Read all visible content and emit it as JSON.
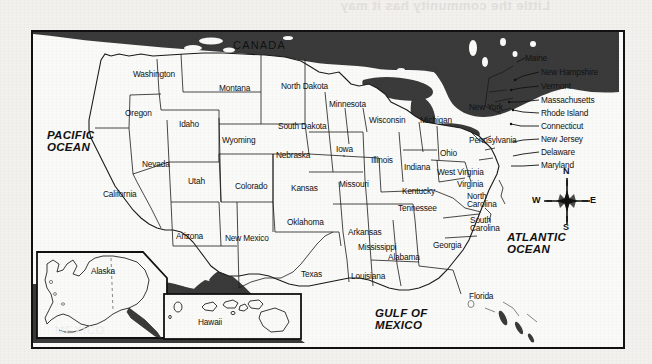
{
  "page": {
    "bleed_through_text": "Little the community has it may",
    "background_color": "#f2f1ee"
  },
  "map": {
    "frame_color": "#111111",
    "land_color": "#fafaf8",
    "water_color": "#3a3a3a",
    "title": "United States political map with state labels",
    "countries": [
      {
        "name": "CANADA",
        "x": 200,
        "y": 14
      },
      {
        "name": "MEXICO",
        "x": 205,
        "y": 295
      }
    ],
    "oceans": [
      {
        "name": "PACIFIC\nOCEAN",
        "line1": "PACIFIC",
        "line2": "OCEAN",
        "x": 14,
        "y": 102
      },
      {
        "name": "ATLANTIC\nOCEAN",
        "line1": "ATLANTIC",
        "line2": "OCEAN",
        "x": 476,
        "y": 205
      },
      {
        "name": "GULF OF\nMEXICO",
        "line1": "GULF OF",
        "line2": "MEXICO",
        "x": 345,
        "y": 281
      }
    ],
    "states": [
      {
        "name": "Washington",
        "x": 100,
        "y": 38
      },
      {
        "name": "Montana",
        "x": 186,
        "y": 52
      },
      {
        "name": "North Dakota",
        "x": 252,
        "y": 50
      },
      {
        "name": "Minnesota",
        "x": 300,
        "y": 68
      },
      {
        "name": "Oregon",
        "x": 92,
        "y": 77
      },
      {
        "name": "Idaho",
        "x": 148,
        "y": 88
      },
      {
        "name": "South Dakota",
        "x": 249,
        "y": 90
      },
      {
        "name": "Wisconsin",
        "x": 340,
        "y": 84
      },
      {
        "name": "Michigan",
        "x": 390,
        "y": 84
      },
      {
        "name": "Wyoming",
        "x": 191,
        "y": 104
      },
      {
        "name": "Nebraska",
        "x": 245,
        "y": 119
      },
      {
        "name": "Iowa",
        "x": 304,
        "y": 113
      },
      {
        "name": "Illinois",
        "x": 341,
        "y": 124
      },
      {
        "name": "Indiana",
        "x": 375,
        "y": 131
      },
      {
        "name": "Ohio",
        "x": 409,
        "y": 117
      },
      {
        "name": "Nevada",
        "x": 112,
        "y": 128
      },
      {
        "name": "Utah",
        "x": 157,
        "y": 145
      },
      {
        "name": "Colorado",
        "x": 206,
        "y": 150
      },
      {
        "name": "Kansas",
        "x": 261,
        "y": 152
      },
      {
        "name": "Missouri",
        "x": 310,
        "y": 148
      },
      {
        "name": "Kentucky",
        "x": 373,
        "y": 155
      },
      {
        "name": "West Virginia",
        "x": 410,
        "y": 136
      },
      {
        "name": "Pennsylvania",
        "x": 441,
        "y": 104
      },
      {
        "name": "Virginia",
        "x": 430,
        "y": 148
      },
      {
        "name": "California",
        "x": 74,
        "y": 158
      },
      {
        "name": "Arizona",
        "x": 145,
        "y": 200
      },
      {
        "name": "New Mexico",
        "x": 198,
        "y": 202
      },
      {
        "name": "Oklahoma",
        "x": 259,
        "y": 186
      },
      {
        "name": "Arkansas",
        "x": 318,
        "y": 196
      },
      {
        "name": "Tennessee",
        "x": 369,
        "y": 172
      },
      {
        "name": "North\nCarolina",
        "l1": "North",
        "l2": "Carolina",
        "x": 436,
        "y": 163
      },
      {
        "name": "South\nCarolina",
        "l1": "South",
        "l2": "Carolina",
        "x": 439,
        "y": 187
      },
      {
        "name": "Mississippi",
        "x": 329,
        "y": 211
      },
      {
        "name": "Alabama",
        "x": 358,
        "y": 221
      },
      {
        "name": "Georgia",
        "x": 404,
        "y": 209
      },
      {
        "name": "Texas",
        "x": 272,
        "y": 238
      },
      {
        "name": "Louisiana",
        "x": 322,
        "y": 240
      },
      {
        "name": "Florida",
        "x": 439,
        "y": 260
      }
    ],
    "northeast_states": [
      {
        "name": "Maine",
        "x": 494,
        "y": 24
      },
      {
        "name": "New Hampshire",
        "x": 509,
        "y": 38
      },
      {
        "name": "Vermont",
        "x": 509,
        "y": 52
      },
      {
        "name": "Massachusetts",
        "x": 509,
        "y": 66
      },
      {
        "name": "New York",
        "x": 440,
        "y": 73
      },
      {
        "name": "Rhode Island",
        "x": 509,
        "y": 79
      },
      {
        "name": "Connecticut",
        "x": 509,
        "y": 92
      },
      {
        "name": "New Jersey",
        "x": 509,
        "y": 105
      },
      {
        "name": "Delaware",
        "x": 509,
        "y": 118
      },
      {
        "name": "Maryland",
        "x": 509,
        "y": 131
      }
    ],
    "insets": [
      {
        "name": "Alaska",
        "label": "Alaska",
        "label_x": 62,
        "label_y": 238,
        "x": 4,
        "y": 220,
        "w": 130,
        "h": 86
      },
      {
        "name": "Hawaii",
        "label": "Hawaii",
        "label_x": 167,
        "label_y": 289,
        "x": 131,
        "y": 262,
        "w": 137,
        "h": 45
      }
    ],
    "compass": {
      "name": "compass-rose",
      "north": "N",
      "south": "S",
      "east": "E",
      "west": "W"
    }
  }
}
